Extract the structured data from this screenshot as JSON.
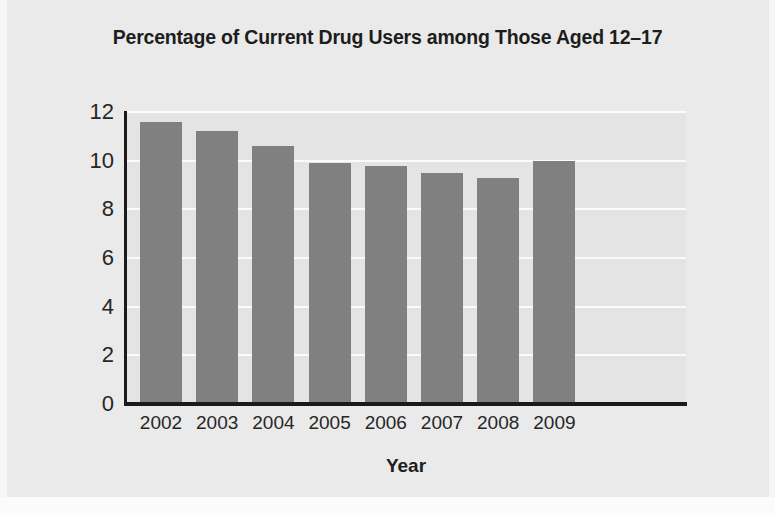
{
  "chart_data": {
    "type": "bar",
    "title": "Percentage of Current Drug Users among Those Aged 12–17",
    "xlabel": "Year",
    "ylabel": "",
    "categories": [
      "2002",
      "2003",
      "2004",
      "2005",
      "2006",
      "2007",
      "2008",
      "2009"
    ],
    "values": [
      11.6,
      11.2,
      10.6,
      9.9,
      9.8,
      9.5,
      9.3,
      10.0
    ],
    "ylim": [
      0,
      12
    ],
    "yticks": [
      0,
      2,
      4,
      6,
      8,
      10,
      12
    ],
    "ytick_labels": [
      "0",
      "2",
      "4",
      "6",
      "8",
      "10",
      "12"
    ],
    "grid": "horizontal",
    "legend": "none",
    "colors": {
      "bar": "#808080",
      "plot_background": "#e4e4e4",
      "page_background": "#eaeaea",
      "gridline": "#fbfbfb",
      "axis": "#1a1a1a",
      "text": "#1d1d1d"
    }
  }
}
